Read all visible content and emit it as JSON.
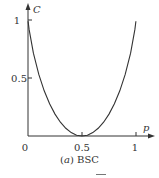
{
  "chart_data": {
    "type": "line",
    "title": "",
    "caption_prefix": "(",
    "caption_letter": "a",
    "caption_suffix": ")",
    "caption_text": "BSC",
    "xlabel": "p",
    "ylabel": "C",
    "xlim": [
      0,
      1
    ],
    "ylim": [
      0,
      1
    ],
    "x_ticks": [
      "0",
      "0.5",
      "1"
    ],
    "y_ticks": [
      "0.5",
      "1"
    ],
    "grid": false,
    "legend": null,
    "series": [
      {
        "name": "C = 1 - H(p)",
        "x": [
          0.001,
          0.01,
          0.05,
          0.1,
          0.15,
          0.2,
          0.25,
          0.3,
          0.35,
          0.4,
          0.45,
          0.5,
          0.55,
          0.6,
          0.65,
          0.7,
          0.75,
          0.8,
          0.85,
          0.9,
          0.95,
          0.99,
          0.999
        ],
        "values": [
          0.989,
          0.919,
          0.714,
          0.531,
          0.39,
          0.278,
          0.189,
          0.119,
          0.066,
          0.029,
          0.007,
          0.0,
          0.007,
          0.029,
          0.066,
          0.119,
          0.189,
          0.278,
          0.39,
          0.531,
          0.714,
          0.919,
          0.989
        ]
      }
    ]
  }
}
